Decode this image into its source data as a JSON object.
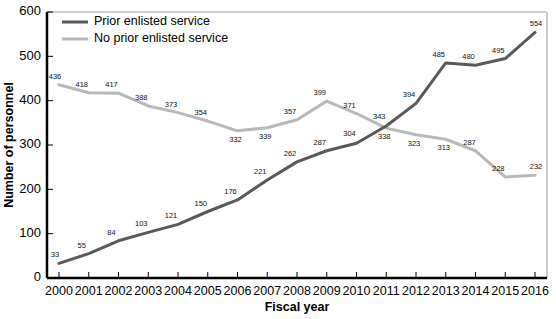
{
  "chart_data": {
    "type": "line",
    "title": "",
    "xlabel": "Fiscal year",
    "ylabel": "Number of personnel",
    "x": [
      2000,
      2001,
      2002,
      2003,
      2004,
      2005,
      2006,
      2007,
      2008,
      2009,
      2010,
      2011,
      2012,
      2013,
      2014,
      2015,
      2016
    ],
    "categories": [
      "2000",
      "2001",
      "2002",
      "2003",
      "2004",
      "2005",
      "2006",
      "2007",
      "2008",
      "2009",
      "2010",
      "2011",
      "2012",
      "2013",
      "2014",
      "2015",
      "2016"
    ],
    "ylim": [
      0,
      600
    ],
    "yticks": [
      0,
      100,
      200,
      300,
      400,
      500,
      600
    ],
    "ytick_labels": [
      "0",
      "100",
      "200",
      "300",
      "400",
      "500",
      "600"
    ],
    "grid": false,
    "legend_position": "top-left",
    "series": [
      {
        "name": "Prior enlisted service",
        "color": "#595959",
        "values": [
          33,
          55,
          84,
          103,
          121,
          150,
          176,
          221,
          262,
          287,
          304,
          343,
          394,
          485,
          480,
          495,
          554
        ],
        "labels": [
          "33",
          "55",
          "84",
          "103",
          "121",
          "150",
          "176",
          "221",
          "262",
          "287",
          "304",
          "343",
          "394",
          "485",
          "480",
          "495",
          "554"
        ]
      },
      {
        "name": "No prior enlisted service",
        "color": "#b8b8b8",
        "values": [
          436,
          418,
          417,
          388,
          373,
          354,
          332,
          339,
          357,
          399,
          371,
          338,
          323,
          313,
          287,
          228,
          232
        ],
        "labels": [
          "436",
          "418",
          "417",
          "388",
          "373",
          "354",
          "332",
          "339",
          "357",
          "399",
          "371",
          "338",
          "323",
          "313",
          "287",
          "228",
          "232"
        ]
      }
    ]
  },
  "legend": {
    "items": [
      {
        "label": "Prior enlisted service",
        "color": "#595959"
      },
      {
        "label": "No prior enlisted service",
        "color": "#b8b8b8"
      }
    ]
  },
  "axes": {
    "y_title": "Number of personnel",
    "x_title": "Fiscal year"
  }
}
